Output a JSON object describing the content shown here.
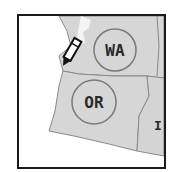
{
  "map": {
    "title": "Pacific Northwest states",
    "states": [
      {
        "abbr": "WA",
        "name": "Washington"
      },
      {
        "abbr": "OR",
        "name": "Oregon"
      },
      {
        "abbr": "I",
        "name": "Idaho (partial)"
      }
    ],
    "colors": {
      "land": "#d6d6d6",
      "border": "#8a8a8a",
      "frame": "#1a1a1a",
      "circle": "#7a7a7a",
      "label": "#2a2a2a"
    },
    "tool_icon": "pencil-icon"
  }
}
